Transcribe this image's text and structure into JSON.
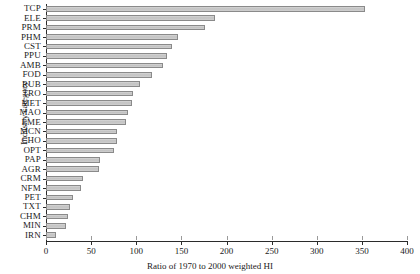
{
  "chart_data": {
    "type": "bar",
    "orientation": "horizontal",
    "title": "",
    "xlabel": "Ratio of 1970 to 2000 weighted HI",
    "ylabel": "Industry category",
    "xlim": [
      0,
      400
    ],
    "xticks": [
      0,
      50,
      100,
      150,
      200,
      250,
      300,
      350,
      400
    ],
    "grid": false,
    "legend": null,
    "bar_fill": "#c9c9c9",
    "bar_border": "#8a8a8a",
    "axis_color": "#2b2b2b",
    "categories": [
      "TCP",
      "ELE",
      "PRM",
      "PHM",
      "CST",
      "PPU",
      "AMB",
      "FOD",
      "RUB",
      "TRO",
      "MET",
      "MAO",
      "EME",
      "MCN",
      "CHO",
      "OPT",
      "PAP",
      "AGR",
      "CRM",
      "NFM",
      "PET",
      "TXT",
      "CHM",
      "MIN",
      "IRN"
    ],
    "values": [
      354,
      187,
      176,
      146,
      140,
      134,
      130,
      117,
      104,
      96,
      95,
      91,
      89,
      79,
      79,
      75,
      60,
      59,
      41,
      39,
      30,
      27,
      24,
      22,
      17
    ],
    "bars": [
      {
        "category": "TCP",
        "value": 354
      },
      {
        "category": "ELE",
        "value": 187
      },
      {
        "category": "PRM",
        "value": 176
      },
      {
        "category": "PHM",
        "value": 146
      },
      {
        "category": "CST",
        "value": 140
      },
      {
        "category": "PPU",
        "value": 134
      },
      {
        "category": "AMB",
        "value": 130
      },
      {
        "category": "FOD",
        "value": 117
      },
      {
        "category": "RUB",
        "value": 104
      },
      {
        "category": "TRO",
        "value": 96
      },
      {
        "category": "MET",
        "value": 95
      },
      {
        "category": "MAO",
        "value": 91
      },
      {
        "category": "EME",
        "value": 89
      },
      {
        "category": "MCN",
        "value": 79
      },
      {
        "category": "CHO",
        "value": 79
      },
      {
        "category": "OPT",
        "value": 75
      },
      {
        "category": "PAP",
        "value": 60
      },
      {
        "category": "AGR",
        "value": 59
      },
      {
        "category": "CRM",
        "value": 41
      },
      {
        "category": "NFM",
        "value": 39
      },
      {
        "category": "PET",
        "value": 30
      },
      {
        "category": "TXT",
        "value": 27
      },
      {
        "category": "CHM",
        "value": 24
      },
      {
        "category": "MIN",
        "value": 22
      },
      {
        "category": "IRN",
        "value": 11
      }
    ]
  }
}
